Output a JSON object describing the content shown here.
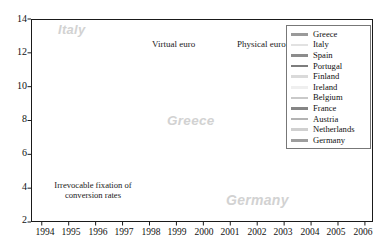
{
  "chart_data": {
    "type": "line",
    "title": "",
    "xlabel": "",
    "ylabel": "",
    "xlim": [
      1993.6,
      2006.3
    ],
    "ylim": [
      2,
      14
    ],
    "yticks": [
      2,
      4,
      6,
      8,
      10,
      12,
      14
    ],
    "xticks": [
      1994,
      1995,
      1996,
      1997,
      1998,
      1999,
      2000,
      2001,
      2002,
      2003,
      2004,
      2005,
      2006
    ],
    "grid": false,
    "legend_position": "top-right",
    "annotations": [
      {
        "text": "Virtual euro",
        "x": 1998.62,
        "y": 13.0
      },
      {
        "text": "Physical euro",
        "x": 2001.72,
        "y": 13.0
      },
      {
        "text": "Irrevocable fixation of",
        "x": 1995.6,
        "y": 3.95
      },
      {
        "text": "conversion rates",
        "x": 1995.6,
        "y": 3.55
      }
    ],
    "watermarks": [
      {
        "text": "Italy",
        "x": 1994.85,
        "y": 13.2
      },
      {
        "text": "Greece",
        "x": 1999.55,
        "y": 8.2
      },
      {
        "text": "Germany",
        "x": 2002.95,
        "y": 3.2
      }
    ],
    "event_bands": [
      {
        "label": "Irrevocable fixation of conversion rates",
        "x": 1997.78
      },
      {
        "label": "Virtual euro",
        "x": 1998.5
      },
      {
        "label": "Physical euro",
        "x": 2001.62
      }
    ],
    "series": [
      {
        "name": "Greece",
        "color": "#9a9a9a",
        "width": 1.5,
        "x": [
          1997.0,
          1997.12,
          1997.25,
          1997.37,
          1997.5,
          1997.62,
          1997.75,
          1997.87,
          1998.0,
          1998.12,
          1998.25,
          1998.37,
          1998.5,
          1998.62,
          1998.75,
          1998.87,
          1999.0,
          1999.12,
          1999.25,
          1999.37,
          1999.5,
          1999.62,
          1999.75,
          1999.87,
          2000.0,
          2000.25,
          2000.5,
          2000.75,
          2001.0,
          2001.25,
          2001.5,
          2001.75,
          2002.0,
          2002.5,
          2003.0,
          2003.5,
          2004.0,
          2004.5,
          2005.0,
          2005.5,
          2005.9
        ],
        "y": [
          9.3,
          9.15,
          9.6,
          10.1,
          10.75,
          10.3,
          10.5,
          9.5,
          8.9,
          8.55,
          8.2,
          8.0,
          8.8,
          7.6,
          7.25,
          6.9,
          6.35,
          6.1,
          6.25,
          6.8,
          6.95,
          6.6,
          6.85,
          6.55,
          6.4,
          6.3,
          6.15,
          5.9,
          5.7,
          5.5,
          5.45,
          5.3,
          5.45,
          5.2,
          4.65,
          4.55,
          4.4,
          4.35,
          3.75,
          3.5,
          4.05
        ]
      },
      {
        "name": "Italy",
        "color": "#e2e2e2",
        "width": 1.3,
        "x": [
          1993.7,
          1993.9,
          1994.1,
          1994.3,
          1994.5,
          1994.62,
          1994.75,
          1994.87,
          1995.0,
          1995.12,
          1995.25,
          1995.5,
          1995.75,
          1996.0,
          1996.25,
          1996.5,
          1996.75,
          1997.0,
          1997.25,
          1997.5,
          1997.75,
          1998.0,
          1998.25,
          1998.5,
          1998.75,
          1999.0,
          1999.25,
          1999.5,
          1999.75,
          2000.0,
          2000.5,
          2001.0,
          2001.5,
          2002.0,
          2002.5,
          2003.0,
          2003.5,
          2004.0,
          2004.5,
          2005.0,
          2005.5,
          2005.9
        ],
        "y": [
          8.7,
          8.9,
          9.8,
          11.0,
          12.2,
          13.4,
          12.6,
          12.7,
          12.3,
          12.6,
          12.2,
          11.6,
          11.0,
          9.9,
          9.2,
          8.6,
          7.6,
          7.0,
          6.8,
          6.3,
          5.6,
          5.0,
          4.9,
          4.6,
          4.3,
          4.35,
          4.9,
          5.6,
          5.65,
          5.85,
          5.6,
          5.2,
          5.25,
          5.3,
          4.85,
          4.35,
          4.3,
          4.25,
          4.2,
          3.55,
          3.35,
          3.95
        ]
      },
      {
        "name": "Spain",
        "color": "#8c8c8c",
        "width": 1.6,
        "x": [
          1993.7,
          1993.9,
          1994.1,
          1994.3,
          1994.5,
          1994.62,
          1994.75,
          1994.87,
          1995.0,
          1995.12,
          1995.25,
          1995.5,
          1995.75,
          1996.0,
          1996.25,
          1996.5,
          1996.75,
          1997.0,
          1997.25,
          1997.5,
          1997.75,
          1998.0,
          1998.25,
          1998.5,
          1998.75,
          1999.0,
          1999.25,
          1999.5,
          1999.75,
          2000.0,
          2000.5,
          2001.0,
          2001.5,
          2002.0,
          2002.5,
          2003.0,
          2003.5,
          2004.0,
          2004.5,
          2005.0,
          2005.5,
          2005.9
        ],
        "y": [
          8.2,
          8.35,
          9.3,
          10.6,
          11.4,
          11.9,
          12.2,
          12.1,
          11.7,
          12.1,
          11.7,
          11.1,
          10.6,
          9.6,
          9.0,
          8.3,
          7.4,
          6.85,
          6.6,
          6.1,
          5.5,
          4.95,
          4.8,
          4.55,
          4.25,
          4.3,
          4.85,
          5.55,
          5.6,
          5.8,
          5.55,
          5.15,
          5.2,
          5.25,
          4.8,
          4.3,
          4.25,
          4.2,
          4.15,
          3.5,
          3.3,
          3.9
        ]
      },
      {
        "name": "Portugal",
        "color": "#7d7d7d",
        "width": 1.7,
        "x": [
          1993.7,
          1993.9,
          1994.1,
          1994.3,
          1994.5,
          1994.75,
          1995.0,
          1995.25,
          1995.5,
          1995.75,
          1996.0,
          1996.25,
          1996.5,
          1996.75,
          1997.0,
          1997.25,
          1997.5,
          1997.75,
          1998.0,
          1998.25,
          1998.5,
          1998.75,
          1999.0,
          1999.25,
          1999.5,
          1999.75,
          2000.0,
          2000.5,
          2001.0,
          2001.5,
          2002.0,
          2002.5,
          2003.0,
          2003.5,
          2004.0,
          2004.5,
          2005.0,
          2005.5,
          2005.9
        ],
        "y": [
          7.9,
          8.1,
          9.0,
          10.2,
          11.1,
          11.8,
          11.5,
          11.6,
          11.0,
          10.5,
          9.5,
          8.9,
          8.2,
          7.3,
          6.8,
          6.5,
          6.05,
          5.45,
          4.9,
          4.75,
          4.5,
          4.2,
          4.25,
          4.8,
          5.5,
          5.55,
          5.75,
          5.5,
          5.1,
          5.15,
          5.2,
          4.75,
          4.3,
          4.2,
          4.15,
          4.1,
          3.45,
          3.25,
          3.88
        ]
      },
      {
        "name": "Finland",
        "color": "#dadada",
        "width": 1.3,
        "x": [
          1993.7,
          1994.0,
          1994.3,
          1994.6,
          1994.9,
          1995.2,
          1995.5,
          1995.8,
          1996.1,
          1996.4,
          1996.7,
          1997.0,
          1997.3,
          1997.6,
          1997.9,
          1998.2,
          1998.5,
          1998.8,
          1999.1,
          1999.4,
          1999.7,
          2000.0,
          2000.5,
          2001.0,
          2001.5,
          2002.0,
          2002.5,
          2003.0,
          2003.5,
          2004.0,
          2004.5,
          2005.0,
          2005.5,
          2005.9
        ],
        "y": [
          6.2,
          7.6,
          9.2,
          9.0,
          10.2,
          10.1,
          9.5,
          8.6,
          7.6,
          7.2,
          6.6,
          6.2,
          5.9,
          5.4,
          5.0,
          4.85,
          4.6,
          4.3,
          4.35,
          4.95,
          5.5,
          5.7,
          5.5,
          5.1,
          5.1,
          5.15,
          4.7,
          4.25,
          4.2,
          4.15,
          4.05,
          3.45,
          3.25,
          3.85
        ]
      },
      {
        "name": "Ireland",
        "color": "#efefef",
        "width": 1.3,
        "x": [
          1993.7,
          1994.0,
          1994.3,
          1994.6,
          1994.9,
          1995.2,
          1995.5,
          1995.8,
          1996.1,
          1996.4,
          1996.7,
          1997.0,
          1997.3,
          1997.6,
          1997.9,
          1998.2,
          1998.5,
          1998.8,
          1999.1,
          1999.4,
          1999.7,
          2000.0,
          2000.5,
          2001.0,
          2001.5,
          2002.0,
          2002.5,
          2003.0,
          2003.5,
          2004.0,
          2004.5,
          2005.0,
          2005.5,
          2005.9
        ],
        "y": [
          6.5,
          7.9,
          9.0,
          8.5,
          8.7,
          8.6,
          8.2,
          7.9,
          7.3,
          7.1,
          6.6,
          6.3,
          6.0,
          5.5,
          5.0,
          4.8,
          4.55,
          4.25,
          4.3,
          4.9,
          5.45,
          5.65,
          5.45,
          5.05,
          5.1,
          5.2,
          4.7,
          4.25,
          4.2,
          4.15,
          4.1,
          3.4,
          3.2,
          3.85
        ]
      },
      {
        "name": "Belgium",
        "color": "#c9c9c9",
        "width": 1.4,
        "x": [
          1993.7,
          1994.0,
          1994.3,
          1994.6,
          1994.9,
          1995.2,
          1995.5,
          1995.8,
          1996.1,
          1996.4,
          1996.7,
          1997.0,
          1997.3,
          1997.6,
          1997.9,
          1998.2,
          1998.5,
          1998.8,
          1999.1,
          1999.4,
          1999.7,
          2000.0,
          2000.5,
          2001.0,
          2001.5,
          2002.0,
          2002.5,
          2003.0,
          2003.5,
          2004.0,
          2004.5,
          2005.0,
          2005.5,
          2005.9
        ],
        "y": [
          6.3,
          7.1,
          7.9,
          7.6,
          8.1,
          8.0,
          7.5,
          7.2,
          6.7,
          6.6,
          6.3,
          6.0,
          5.75,
          5.35,
          4.9,
          4.75,
          4.5,
          4.2,
          4.25,
          4.85,
          5.4,
          5.6,
          5.4,
          5.0,
          5.05,
          5.15,
          4.65,
          4.2,
          4.15,
          4.12,
          4.05,
          3.4,
          3.2,
          3.82
        ]
      },
      {
        "name": "France",
        "color": "#858585",
        "width": 1.6,
        "x": [
          1993.7,
          1994.0,
          1994.3,
          1994.6,
          1994.9,
          1995.2,
          1995.5,
          1995.8,
          1996.1,
          1996.4,
          1996.7,
          1997.0,
          1997.3,
          1997.6,
          1997.9,
          1998.2,
          1998.5,
          1998.8,
          1999.1,
          1999.4,
          1999.7,
          2000.0,
          2000.5,
          2001.0,
          2001.5,
          2002.0,
          2002.5,
          2003.0,
          2003.5,
          2004.0,
          2004.5,
          2005.0,
          2005.5,
          2005.9
        ],
        "y": [
          6.0,
          6.9,
          7.7,
          7.4,
          8.0,
          7.9,
          7.3,
          7.0,
          6.5,
          6.4,
          6.1,
          5.85,
          5.6,
          5.2,
          4.8,
          4.65,
          4.4,
          4.15,
          4.2,
          4.8,
          5.35,
          5.55,
          5.35,
          4.95,
          5.0,
          5.1,
          4.6,
          4.15,
          4.1,
          4.08,
          4.0,
          3.38,
          3.15,
          3.78
        ]
      },
      {
        "name": "Austria",
        "color": "#b3b3b3",
        "width": 1.4,
        "x": [
          1993.7,
          1994.0,
          1994.3,
          1994.6,
          1994.9,
          1995.2,
          1995.5,
          1995.8,
          1996.1,
          1996.4,
          1996.7,
          1997.0,
          1997.3,
          1997.6,
          1997.9,
          1998.2,
          1998.5,
          1998.8,
          1999.1,
          1999.4,
          1999.7,
          2000.0,
          2000.5,
          2001.0,
          2001.5,
          2002.0,
          2002.5,
          2003.0,
          2003.5,
          2004.0,
          2004.5,
          2005.0,
          2005.5,
          2005.9
        ],
        "y": [
          5.95,
          6.85,
          7.6,
          7.3,
          7.9,
          7.8,
          7.25,
          6.95,
          6.45,
          6.35,
          6.05,
          5.8,
          5.55,
          5.15,
          4.78,
          4.6,
          4.38,
          4.12,
          4.18,
          4.78,
          5.3,
          5.5,
          5.3,
          4.92,
          4.98,
          5.08,
          4.58,
          4.12,
          4.08,
          4.05,
          3.98,
          3.35,
          3.12,
          3.76
        ]
      },
      {
        "name": "Netherlands",
        "color": "#d0d0d0",
        "width": 1.3,
        "x": [
          1993.7,
          1994.0,
          1994.3,
          1994.6,
          1994.9,
          1995.2,
          1995.5,
          1995.8,
          1996.1,
          1996.4,
          1996.7,
          1997.0,
          1997.3,
          1997.6,
          1997.9,
          1998.2,
          1998.5,
          1998.8,
          1999.1,
          1999.4,
          1999.7,
          2000.0,
          2000.5,
          2001.0,
          2001.5,
          2002.0,
          2002.5,
          2003.0,
          2003.5,
          2004.0,
          2004.5,
          2005.0,
          2005.5,
          2005.9
        ],
        "y": [
          5.85,
          6.75,
          7.5,
          7.2,
          7.8,
          7.7,
          7.15,
          6.85,
          6.4,
          6.3,
          6.0,
          5.75,
          5.5,
          5.1,
          4.72,
          4.55,
          4.32,
          4.08,
          4.14,
          4.74,
          5.26,
          5.46,
          5.26,
          4.88,
          4.94,
          5.04,
          4.54,
          4.08,
          4.04,
          4.02,
          3.95,
          3.32,
          3.1,
          3.74
        ]
      },
      {
        "name": "Germany",
        "color": "#9e9e9e",
        "width": 1.6,
        "x": [
          1993.7,
          1994.0,
          1994.3,
          1994.6,
          1994.9,
          1995.2,
          1995.5,
          1995.8,
          1996.1,
          1996.4,
          1996.7,
          1997.0,
          1997.3,
          1997.6,
          1997.9,
          1998.2,
          1998.5,
          1998.8,
          1999.1,
          1999.4,
          1999.7,
          2000.0,
          2000.5,
          2001.0,
          2001.5,
          2002.0,
          2002.5,
          2003.0,
          2003.5,
          2004.0,
          2004.5,
          2005.0,
          2005.5,
          2005.9
        ],
        "y": [
          5.75,
          6.7,
          7.45,
          7.15,
          7.7,
          7.6,
          7.1,
          6.8,
          6.35,
          6.25,
          5.95,
          5.7,
          5.45,
          5.05,
          4.68,
          4.5,
          4.28,
          4.02,
          4.1,
          4.7,
          5.2,
          5.4,
          5.2,
          4.82,
          4.9,
          5.0,
          4.5,
          4.05,
          4.0,
          3.98,
          3.9,
          3.3,
          3.08,
          3.7
        ]
      }
    ]
  },
  "legend": {
    "items": [
      {
        "label": "Greece",
        "color": "#9a9a9a"
      },
      {
        "label": "Italy",
        "color": "#e2e2e2"
      },
      {
        "label": "Spain",
        "color": "#8c8c8c"
      },
      {
        "label": "Portugal",
        "color": "#7d7d7d"
      },
      {
        "label": "Finland",
        "color": "#dadada"
      },
      {
        "label": "Ireland",
        "color": "#efefef"
      },
      {
        "label": "Belgium",
        "color": "#c9c9c9"
      },
      {
        "label": "France",
        "color": "#858585"
      },
      {
        "label": "Austria",
        "color": "#b3b3b3"
      },
      {
        "label": "Netherlands",
        "color": "#d0d0d0"
      },
      {
        "label": "Germany",
        "color": "#9e9e9e"
      }
    ]
  },
  "axis": {
    "y_labels": [
      "14",
      "12",
      "10",
      "8",
      "6",
      "4",
      "2"
    ],
    "x_labels": [
      "1994",
      "1995",
      "1996",
      "1997",
      "1998",
      "1999",
      "2000",
      "2001",
      "2002",
      "2003",
      "2004",
      "2005",
      "2006"
    ]
  },
  "labels": {
    "virtual_euro": "Virtual euro",
    "physical_euro": "Physical euro",
    "fixation_line1": "Irrevocable fixation of",
    "fixation_line2": "conversion rates",
    "watermark_italy": "Italy",
    "watermark_greece": "Greece",
    "watermark_germany": "Germany"
  },
  "colors": {
    "band": "#ececec",
    "frame": "#1a1a1a",
    "watermark": "#d2d2d2"
  }
}
